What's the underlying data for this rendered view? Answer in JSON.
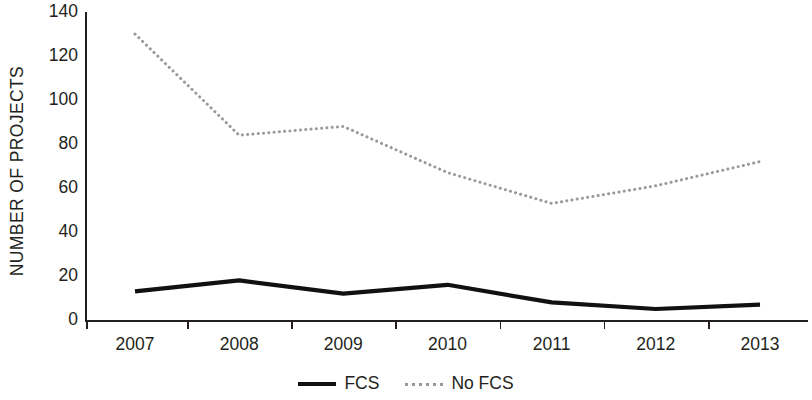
{
  "chart_data": {
    "type": "line",
    "title": "",
    "subtitle": "",
    "xlabel": "",
    "ylabel": "NUMBER OF PROJECTS",
    "categories": [
      "2007",
      "2008",
      "2009",
      "2010",
      "2011",
      "2012",
      "2013"
    ],
    "x": [
      2007,
      2008,
      2009,
      2010,
      2011,
      2012,
      2013
    ],
    "series": [
      {
        "name": "FCS",
        "values": [
          13,
          18,
          12,
          16,
          8,
          5,
          7
        ],
        "style": "solid",
        "color": "#111111",
        "line_width": 4.2
      },
      {
        "name": "No FCS",
        "values": [
          130,
          84,
          88,
          67,
          53,
          61,
          72
        ],
        "style": "dotted",
        "color": "#9a9a9a",
        "line_width": 3
      }
    ],
    "ylim": [
      0,
      140
    ],
    "ytick_values": [
      0,
      20,
      40,
      60,
      80,
      100,
      120,
      140
    ],
    "ytick_labels": [
      "0",
      "20",
      "40",
      "60",
      "80",
      "100",
      "120",
      "140"
    ],
    "grid": false,
    "legend_position": "bottom-center",
    "legend_entries": [
      "FCS",
      "No FCS"
    ],
    "background_color": "#ffffff",
    "axis_color": "#231f20"
  },
  "legend": {
    "entries": [
      {
        "label": "FCS",
        "swatch": "solid-line-swatch"
      },
      {
        "label": "No FCS",
        "swatch": "dotted-line-swatch"
      }
    ]
  }
}
